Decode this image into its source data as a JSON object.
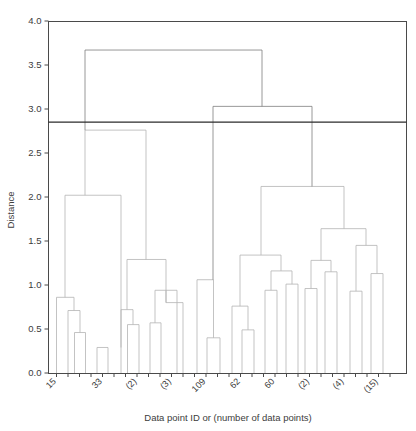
{
  "chart_data": {
    "type": "dendrogram",
    "title": "",
    "xlabel": "Data point ID or (number of data points)",
    "ylabel": "Distance",
    "ylim": [
      0.0,
      4.0
    ],
    "yticks": [
      "0.0",
      "0.5",
      "1.0",
      "1.5",
      "2.0",
      "2.5",
      "3.0",
      "3.5",
      "4.0"
    ],
    "ytick_values": [
      0.0,
      0.5,
      1.0,
      1.5,
      2.0,
      2.5,
      3.0,
      3.5,
      4.0
    ],
    "grid": false,
    "legend": null,
    "cut_line": {
      "value": 2.85,
      "color": "#2b2b2b",
      "orientation": "horizontal"
    },
    "xtick_labels": [
      "15",
      "33",
      "(2)",
      "(3)",
      "109",
      "62",
      "60",
      "(2)",
      "(4)",
      "(15)"
    ],
    "xtick_label_rotation": 45,
    "n_leaves": 30,
    "leaves": [
      {
        "index": 0,
        "label": "15",
        "x": 56.5
      },
      {
        "index": 1,
        "label": "",
        "x": 68.0
      },
      {
        "index": 2,
        "label": "",
        "x": 79.5
      },
      {
        "index": 3,
        "label": "",
        "x": 91.0
      },
      {
        "index": 4,
        "label": "33",
        "x": 102.5
      },
      {
        "index": 5,
        "label": "",
        "x": 114.0
      },
      {
        "index": 6,
        "label": "",
        "x": 125.5
      },
      {
        "index": 7,
        "label": "(2)",
        "x": 137.0
      },
      {
        "index": 8,
        "label": "",
        "x": 148.5
      },
      {
        "index": 9,
        "label": "",
        "x": 160.0
      },
      {
        "index": 10,
        "label": "(3)",
        "x": 171.5
      },
      {
        "index": 11,
        "label": "",
        "x": 183.0
      },
      {
        "index": 12,
        "label": "",
        "x": 194.5
      },
      {
        "index": 13,
        "label": "109",
        "x": 206.0
      },
      {
        "index": 14,
        "label": "",
        "x": 217.5
      },
      {
        "index": 15,
        "label": "",
        "x": 229.0
      },
      {
        "index": 16,
        "label": "62",
        "x": 240.5
      },
      {
        "index": 17,
        "label": "",
        "x": 252.0
      },
      {
        "index": 18,
        "label": "",
        "x": 263.5
      },
      {
        "index": 19,
        "label": "60",
        "x": 275.0
      },
      {
        "index": 20,
        "label": "",
        "x": 286.5
      },
      {
        "index": 21,
        "label": "",
        "x": 298.0
      },
      {
        "index": 22,
        "label": "(2)",
        "x": 309.5
      },
      {
        "index": 23,
        "label": "",
        "x": 321.0
      },
      {
        "index": 24,
        "label": "",
        "x": 332.5
      },
      {
        "index": 25,
        "label": "(4)",
        "x": 344.0
      },
      {
        "index": 26,
        "label": "",
        "x": 355.5
      },
      {
        "index": 27,
        "label": "",
        "x": 367.0
      },
      {
        "index": 28,
        "label": "(15)",
        "x": 378.5
      },
      {
        "index": 29,
        "label": "",
        "x": 390.0
      }
    ],
    "merges": [
      {
        "id": "m1",
        "left_x": 56.5,
        "right_x": 74.0,
        "left_h": 0.0,
        "right_h": 0.71,
        "height": 0.86
      },
      {
        "id": "m2",
        "left_x": 68.0,
        "right_x": 80.0,
        "left_h": 0.0,
        "right_h": 0.46,
        "height": 0.71
      },
      {
        "id": "m3",
        "left_x": 74.5,
        "right_x": 85.5,
        "left_h": 0.0,
        "right_h": 0.0,
        "height": 0.46
      },
      {
        "id": "m4",
        "left_x": 97.0,
        "right_x": 108.0,
        "left_h": 0.0,
        "right_h": 0.0,
        "height": 0.29
      },
      {
        "id": "m5",
        "left_x": 65.0,
        "right_x": 121.0,
        "left_h": 0.86,
        "right_h": 0.29,
        "height": 2.02
      },
      {
        "id": "m6",
        "left_x": 121.0,
        "right_x": 133.0,
        "left_h": 0.0,
        "right_h": 0.55,
        "height": 0.72
      },
      {
        "id": "m7",
        "left_x": 127.5,
        "right_x": 139.0,
        "left_h": 0.0,
        "right_h": 0.0,
        "height": 0.55
      },
      {
        "id": "m8",
        "left_x": 127.0,
        "right_x": 166.0,
        "left_h": 0.72,
        "right_h": 0.8,
        "height": 1.29
      },
      {
        "id": "m9",
        "left_x": 155.0,
        "right_x": 177.0,
        "left_h": 0.57,
        "right_h": 0.0,
        "height": 0.94
      },
      {
        "id": "m10",
        "left_x": 150.0,
        "right_x": 161.0,
        "left_h": 0.0,
        "right_h": 0.0,
        "height": 0.57
      },
      {
        "id": "m11",
        "left_x": 166.0,
        "right_x": 183.0,
        "left_h": 0.94,
        "right_h": 0.0,
        "height": 0.8
      },
      {
        "id": "m12",
        "left_x": 85.0,
        "right_x": 146.0,
        "left_h": 2.02,
        "right_h": 1.29,
        "height": 2.76
      },
      {
        "id": "m13",
        "left_x": 197.0,
        "right_x": 213.5,
        "left_h": 0.0,
        "right_h": 0.4,
        "height": 1.06
      },
      {
        "id": "m14",
        "left_x": 207.0,
        "right_x": 220.0,
        "left_h": 0.0,
        "right_h": 0.0,
        "height": 0.4
      },
      {
        "id": "m15",
        "left_x": 232.0,
        "right_x": 248.0,
        "left_h": 0.0,
        "right_h": 0.49,
        "height": 0.76
      },
      {
        "id": "m16",
        "left_x": 242.0,
        "right_x": 254.0,
        "left_h": 0.0,
        "right_h": 0.0,
        "height": 0.49
      },
      {
        "id": "m17",
        "left_x": 240.0,
        "right_x": 281.0,
        "left_h": 0.76,
        "right_h": 1.16,
        "height": 1.34
      },
      {
        "id": "m18",
        "left_x": 271.0,
        "right_x": 292.0,
        "left_h": 0.94,
        "right_h": 1.01,
        "height": 1.16
      },
      {
        "id": "m19",
        "left_x": 265.0,
        "right_x": 277.0,
        "left_h": 0.0,
        "right_h": 0.0,
        "height": 0.94
      },
      {
        "id": "m20",
        "left_x": 286.0,
        "right_x": 298.0,
        "left_h": 0.0,
        "right_h": 0.0,
        "height": 1.01
      },
      {
        "id": "m21",
        "left_x": 311.0,
        "right_x": 331.0,
        "left_h": 0.96,
        "right_h": 1.15,
        "height": 1.28
      },
      {
        "id": "m22",
        "left_x": 305.0,
        "right_x": 317.0,
        "left_h": 0.0,
        "right_h": 0.0,
        "height": 0.96
      },
      {
        "id": "m23",
        "left_x": 325.0,
        "right_x": 337.0,
        "left_h": 0.0,
        "right_h": 0.0,
        "height": 1.15
      },
      {
        "id": "m24",
        "left_x": 321.0,
        "right_x": 366.0,
        "left_h": 1.28,
        "right_h": 1.45,
        "height": 1.64
      },
      {
        "id": "m25",
        "left_x": 356.0,
        "right_x": 377.0,
        "left_h": 0.93,
        "right_h": 1.13,
        "height": 1.45
      },
      {
        "id": "m26",
        "left_x": 350.0,
        "right_x": 362.0,
        "left_h": 0.0,
        "right_h": 0.0,
        "height": 0.93
      },
      {
        "id": "m27",
        "left_x": 371.0,
        "right_x": 383.0,
        "left_h": 0.0,
        "right_h": 0.0,
        "height": 1.13
      },
      {
        "id": "m28",
        "left_x": 261.0,
        "right_x": 344.0,
        "left_h": 1.34,
        "right_h": 1.64,
        "height": 2.12
      },
      {
        "id": "m29",
        "left_x": 213.0,
        "right_x": 312.0,
        "left_h": 1.06,
        "right_h": 2.12,
        "height": 3.03
      },
      {
        "id": "m30",
        "left_x": 85.0,
        "right_x": 262.0,
        "left_h": 2.76,
        "right_h": 3.03,
        "height": 3.67
      }
    ]
  }
}
